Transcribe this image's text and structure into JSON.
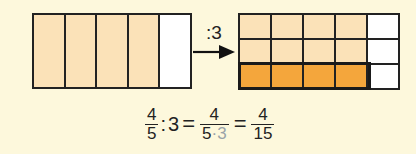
{
  "left_bar": {
    "columns": 5,
    "shaded": 4,
    "shaded_color": "#fbe2b8"
  },
  "operation": {
    "label": ":3"
  },
  "right_bar": {
    "columns": 5,
    "rows": 3,
    "shaded_columns": 4,
    "light_color": "#fbe2b8",
    "highlight_color": "#f4a63c",
    "highlight_row": 3
  },
  "formula": {
    "f1_num": "4",
    "f1_den": "5",
    "div": ":",
    "divisor": "3",
    "eq1": "=",
    "f2_num": "4",
    "f2_den_a": "5",
    "f2_dot": "·",
    "f2_den_b": "3",
    "eq2": "=",
    "f3_num": "4",
    "f3_den": "15"
  }
}
